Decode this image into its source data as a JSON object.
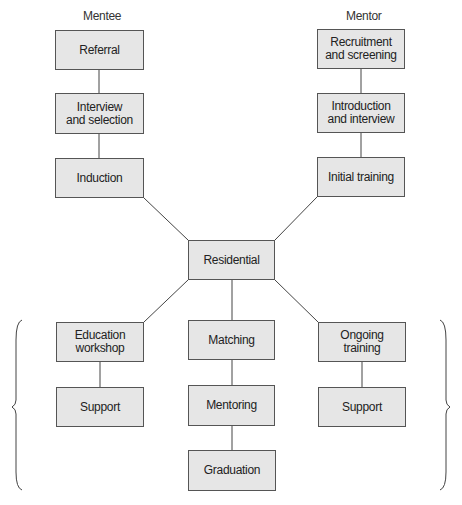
{
  "headers": {
    "mentee": "Mentee",
    "mentor": "Mentor"
  },
  "mentee": {
    "referral": "Referral",
    "interview": "Interview\nand selection",
    "induction": "Induction"
  },
  "mentor": {
    "recruitment": "Recruitment\nand screening",
    "introduction": "Introduction\nand interview",
    "initial_training": "Initial training"
  },
  "center": {
    "residential": "Residential"
  },
  "bottom": {
    "education_workshop": "Education\nworkshop",
    "matching": "Matching",
    "ongoing_training": "Ongoing\ntraining",
    "support_left": "Support",
    "mentoring": "Mentoring",
    "support_right": "Support",
    "graduation": "Graduation"
  },
  "colors": {
    "box_fill": "#e6e6e6",
    "box_border": "#555555",
    "line": "#444444"
  }
}
